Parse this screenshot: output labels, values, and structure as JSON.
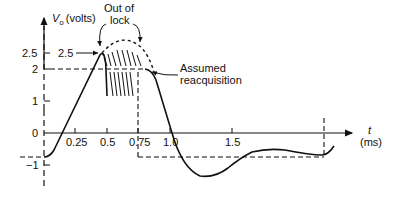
{
  "diagram": {
    "title": "",
    "y_axis": {
      "label_symbol": "V",
      "label_subscript": "o",
      "label_units": "(volts)",
      "ticks": [
        "2.5",
        "2",
        "1",
        "0",
        "−1"
      ]
    },
    "x_axis": {
      "label_symbol": "t",
      "label_units": "(ms)",
      "ticks": [
        "0.25",
        "0.5",
        "0.75",
        "1.0",
        "1.5"
      ]
    },
    "annotations": {
      "out_of_lock_line1": "Out of",
      "out_of_lock_line2": "lock",
      "peak_value": "2.5",
      "reacq_line1": "Assumed",
      "reacq_line2": "reacquisition"
    },
    "colors": {
      "ink": "#111111",
      "background": "#ffffff"
    }
  }
}
